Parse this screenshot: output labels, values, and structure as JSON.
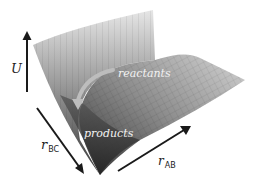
{
  "figure": {
    "type": "potential energy surface",
    "axes": {
      "vertical": {
        "label": "U"
      },
      "left": {
        "label": "r",
        "subscript": "BC"
      },
      "right": {
        "label": "r",
        "subscript": "AB"
      }
    },
    "annotations": {
      "reactants": "reactants",
      "products": "products"
    },
    "colors": {
      "surface_light": "#d0d0d0",
      "surface_mid": "#8a8a8a",
      "surface_dark": "#2e2e2e",
      "arrow": "#1a1a1a",
      "path_arrow": "#b8b8b8"
    }
  }
}
